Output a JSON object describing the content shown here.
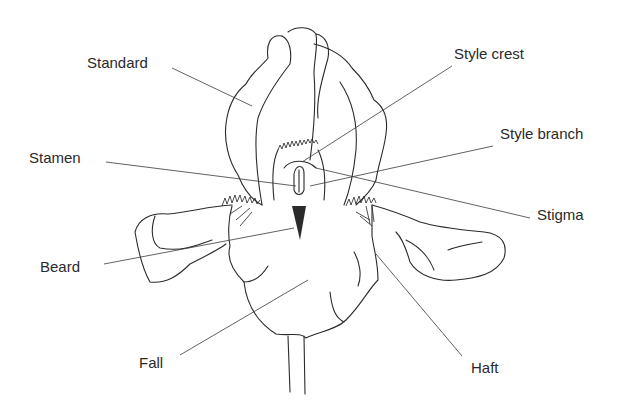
{
  "diagram": {
    "labels": [
      {
        "id": "standard",
        "text": "Standard",
        "x": 87,
        "y": 55
      },
      {
        "id": "stamen",
        "text": "Stamen",
        "x": 29,
        "y": 150
      },
      {
        "id": "beard",
        "text": "Beard",
        "x": 40,
        "y": 259
      },
      {
        "id": "fall",
        "text": "Fall",
        "x": 139,
        "y": 355
      },
      {
        "id": "style-crest",
        "text": "Style crest",
        "x": 454,
        "y": 46
      },
      {
        "id": "style-branch",
        "text": "Style branch",
        "x": 500,
        "y": 126
      },
      {
        "id": "stigma",
        "text": "Stigma",
        "x": 537,
        "y": 207
      },
      {
        "id": "haft",
        "text": "Haft",
        "x": 471,
        "y": 360
      }
    ],
    "colors": {
      "line": "#2b2b2b",
      "text": "#2a2a2a",
      "background": "#ffffff"
    }
  }
}
